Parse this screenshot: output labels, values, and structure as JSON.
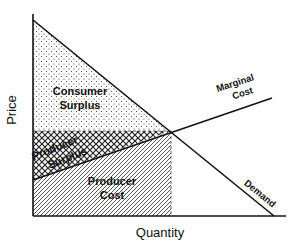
{
  "diagram": {
    "type": "supply-demand-surplus",
    "axes": {
      "x_label": "Price_placeholder_unused",
      "xlabel": "Quantity",
      "ylabel": "Price"
    },
    "curves": {
      "marginal_cost": {
        "label_line1": "Marginal",
        "label_line2": "Cost"
      },
      "demand": {
        "label": "Demand"
      }
    },
    "regions": {
      "consumer_surplus": {
        "line1": "Consumer",
        "line2": "Surplus",
        "fill": "dotted"
      },
      "producer_surplus": {
        "line1": "Producer",
        "line2": "Surplus",
        "fill": "crosshatch"
      },
      "producer_cost": {
        "line1": "Producer",
        "line2": "Cost",
        "fill": "diagonal-hatch"
      }
    },
    "colors": {
      "ink": "#111111",
      "background": "#ffffff"
    }
  }
}
